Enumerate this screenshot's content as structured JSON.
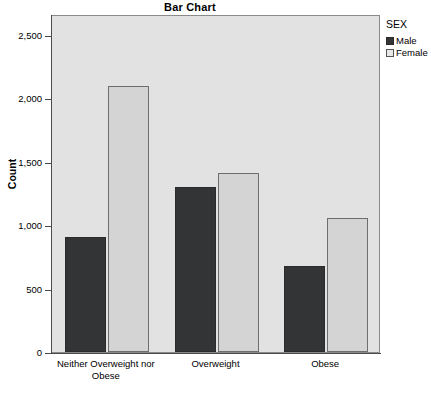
{
  "chart_data": {
    "type": "bar",
    "title": "Bar Chart",
    "xlabel": "",
    "ylabel": "Count",
    "categories": [
      "Neither Overweight nor Obese",
      "Overweight",
      "Obese"
    ],
    "category_lines": [
      [
        "Neither Overweight nor",
        "Obese"
      ],
      [
        "Overweight"
      ],
      [
        "Obese"
      ]
    ],
    "series": [
      {
        "name": "Male",
        "values": [
          910,
          1300,
          680
        ],
        "color": "#333436"
      },
      {
        "name": "Female",
        "values": [
          2100,
          1410,
          1060
        ],
        "color": "#d4d4d4"
      }
    ],
    "ylim": [
      0,
      2500
    ],
    "yticks": [
      0,
      500,
      1000,
      1500,
      2000,
      2500
    ],
    "ytick_labels": [
      "0",
      "500",
      "1,000",
      "1,500",
      "2,000",
      "2,500"
    ],
    "grid": false,
    "legend_position": "right",
    "legend_title": "SEX",
    "plot_background": "#e2e2e2"
  }
}
